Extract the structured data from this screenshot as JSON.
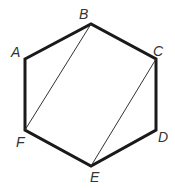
{
  "diagram": {
    "type": "hexagon",
    "vertices": [
      {
        "label": "A",
        "x": 25,
        "y": 59,
        "lx": 11,
        "ly": 57
      },
      {
        "label": "B",
        "x": 91,
        "y": 24,
        "lx": 79,
        "ly": 19
      },
      {
        "label": "C",
        "x": 156,
        "y": 59,
        "lx": 153,
        "ly": 56
      },
      {
        "label": "D",
        "x": 156,
        "y": 130,
        "lx": 158,
        "ly": 142
      },
      {
        "label": "E",
        "x": 91,
        "y": 166,
        "lx": 90,
        "ly": 182
      },
      {
        "label": "F",
        "x": 25,
        "y": 130,
        "lx": 16,
        "ly": 147
      }
    ],
    "diagonals": [
      {
        "from": "B",
        "to": "F"
      },
      {
        "from": "C",
        "to": "E"
      }
    ],
    "colors": {
      "edge": "#1a1a1a",
      "diagonal": "#333333",
      "label": "#333333"
    }
  }
}
